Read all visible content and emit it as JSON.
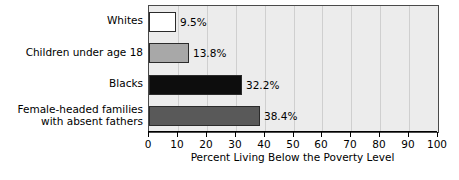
{
  "chart_data": {
    "type": "bar",
    "orientation": "horizontal",
    "title": "",
    "xlabel": "Percent Living Below the Poverty Level",
    "ylabel": "",
    "xlim": [
      0,
      100
    ],
    "xticks": [
      0,
      10,
      20,
      30,
      40,
      50,
      60,
      70,
      80,
      90,
      100
    ],
    "xtick_labels": [
      "0",
      "10",
      "20",
      "30",
      "40",
      "50",
      "60",
      "70",
      "80",
      "90",
      "100"
    ],
    "grid": true,
    "grid_axis": "x",
    "legend": false,
    "categories": [
      "Whites",
      "Children under age 18",
      "Blacks",
      "Female-headed families\nwith absent fathers"
    ],
    "values": [
      9.5,
      13.8,
      32.2,
      38.4
    ],
    "value_labels": [
      "9.5%",
      "13.8%",
      "32.2%",
      "38.4%"
    ],
    "bar_colors": [
      "#ffffff",
      "#a8a8a8",
      "#0d0d0d",
      "#595959"
    ],
    "bar_edge_color": "#2b2b2b",
    "plot_background": "#ececec",
    "gridline_color": "#cfcfcf",
    "axis_color": "#4a4a4a"
  },
  "caption": ""
}
